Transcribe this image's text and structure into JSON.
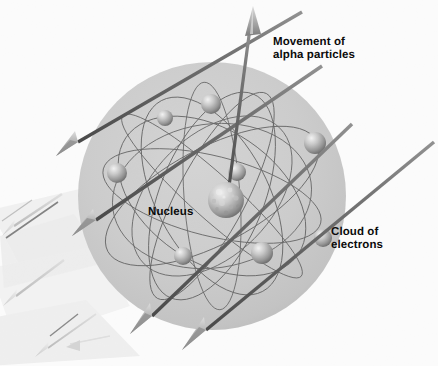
{
  "figure": {
    "background_color": "#fbfbfb"
  },
  "labels": {
    "movement": "Movement of\nalpha particles",
    "nucleus": "Nucleus",
    "cloud": "Cloud of\nelectrons"
  },
  "colors": {
    "background": "#fbfbfb",
    "cloud_fill": "#c9c9c9",
    "cloud_fill_edge": "#bcbcbc",
    "orbit_line": "#4d4d4d",
    "arrow_shaft_dark": "#5a5a5a",
    "arrow_shaft_light": "#b5b5b5",
    "arrow_head": "#9a9a9a",
    "electron_light": "#e6e6e6",
    "electron_dark": "#6f6f6f",
    "nucleus_light": "#e3e3e3",
    "nucleus_dark": "#5e5e5e",
    "label_text": "#0b0b0b",
    "ghost_shape": "#ededed"
  },
  "diagram_data": {
    "type": "scientific-illustration",
    "subject": "Rutherford gold foil scattering / nuclear atom model",
    "electron_cloud": {
      "center_x": 212,
      "center_y": 196,
      "radius": 134
    },
    "nucleus": {
      "center_x": 226,
      "center_y": 200,
      "radius": 18,
      "texture": "cratered"
    },
    "electrons": [
      {
        "cx": 165,
        "cy": 118,
        "r": 8
      },
      {
        "cx": 211,
        "cy": 104,
        "r": 10
      },
      {
        "cx": 315,
        "cy": 143,
        "r": 11
      },
      {
        "cx": 117,
        "cy": 173,
        "r": 10
      },
      {
        "cx": 237,
        "cy": 172,
        "r": 9
      },
      {
        "cx": 323,
        "cy": 238,
        "r": 9
      },
      {
        "cx": 183,
        "cy": 256,
        "r": 9
      },
      {
        "cx": 262,
        "cy": 253,
        "r": 11
      }
    ],
    "orbit_ellipses": [
      {
        "cx": 212,
        "cy": 196,
        "rx": 118,
        "ry": 48,
        "rot": -28
      },
      {
        "cx": 212,
        "cy": 196,
        "rx": 112,
        "ry": 40,
        "rot": 14
      },
      {
        "cx": 212,
        "cy": 196,
        "rx": 108,
        "ry": 56,
        "rot": 62
      },
      {
        "cx": 212,
        "cy": 196,
        "rx": 116,
        "ry": 34,
        "rot": -62
      },
      {
        "cx": 212,
        "cy": 196,
        "rx": 104,
        "ry": 66,
        "rot": 34
      },
      {
        "cx": 212,
        "cy": 196,
        "rx": 114,
        "ry": 28,
        "rot": 86
      },
      {
        "cx": 212,
        "cy": 196,
        "rx": 100,
        "ry": 72,
        "rot": -8
      },
      {
        "cx": 212,
        "cy": 196,
        "rx": 110,
        "ry": 52,
        "rot": 112
      }
    ],
    "alpha_arrows": [
      {
        "name": "arrow-deflected-up",
        "x1": 228,
        "y1": 192,
        "x2": 253,
        "y2": 8,
        "tone": "dark"
      },
      {
        "name": "arrow-upper-straight",
        "x1": 300,
        "y1": 13,
        "x2": 58,
        "y2": 153,
        "tone": "dark"
      },
      {
        "name": "arrow-second-straight",
        "x1": 320,
        "y1": 66,
        "x2": 78,
        "y2": 232,
        "tone": "dark"
      },
      {
        "name": "arrow-third-straight",
        "x1": 352,
        "y1": 125,
        "x2": 133,
        "y2": 330,
        "tone": "dark"
      },
      {
        "name": "arrow-fourth-straight",
        "x1": 432,
        "y1": 143,
        "x2": 186,
        "y2": 348,
        "tone": "dark"
      },
      {
        "name": "arrow-ghost-upper",
        "x1": 60,
        "y1": 196,
        "x2": 0,
        "y2": 236,
        "tone": "light"
      },
      {
        "name": "arrow-ghost-lower",
        "x1": 60,
        "y1": 262,
        "x2": 0,
        "y2": 306,
        "tone": "light"
      },
      {
        "name": "arrow-ghost-bottom",
        "x1": 92,
        "y1": 318,
        "x2": 34,
        "y2": 356,
        "tone": "light"
      }
    ],
    "annotations": [
      {
        "id": "movement",
        "x": 273,
        "y": 36,
        "text": "Movement of alpha particles"
      },
      {
        "id": "nucleus",
        "x": 148,
        "y": 206,
        "text": "Nucleus"
      },
      {
        "id": "cloud",
        "x": 331,
        "y": 226,
        "text": "Cloud of electrons"
      }
    ]
  }
}
